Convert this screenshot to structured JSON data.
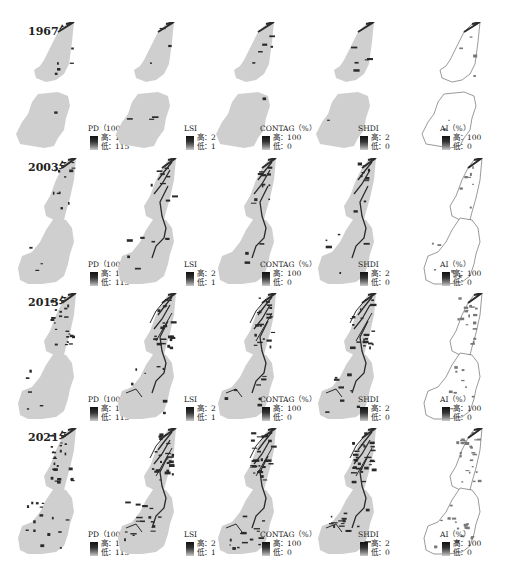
{
  "figure": {
    "years": [
      "1967年",
      "2003年",
      "2013年",
      "2021年"
    ],
    "indices": [
      {
        "key": "PD",
        "title": "PD（100公顷）",
        "high": "高：1040",
        "low": "低：115"
      },
      {
        "key": "LSI",
        "title": "LSI",
        "high": "高：2",
        "low": "低：1"
      },
      {
        "key": "CONTAG",
        "title": "CONTAG（%）",
        "high": "高：100",
        "low": "低：0"
      },
      {
        "key": "SHDI",
        "title": "SHDI",
        "high": "高：2",
        "low": "低：0"
      },
      {
        "key": "AI",
        "title": "AI（%）",
        "high": "高：100",
        "low": "低：0"
      }
    ],
    "colors": {
      "land_fill": "#cfcfcf",
      "ai_fill": "#ffffff",
      "feature_dark": "#2a2a2a",
      "outline": "#555555",
      "background": "#ffffff"
    }
  },
  "rows": [
    {
      "year": "1967年"
    },
    {
      "year": "2003年"
    },
    {
      "year": "2013年"
    },
    {
      "year": "2021年"
    }
  ],
  "legends": {
    "PD": {
      "title": "PD（100公顷）",
      "high": "高：1040",
      "low": "低：115"
    },
    "LSI": {
      "title": "LSI",
      "high": "高：2",
      "low": "低：1"
    },
    "CONTAG": {
      "title": "CONTAG（%）",
      "high": "高：100",
      "low": "低：0"
    },
    "SHDI": {
      "title": "SHDI",
      "high": "高：2",
      "low": "低：0"
    },
    "AI": {
      "title": "AI（%）",
      "high": "高：100",
      "low": "低：0"
    }
  }
}
